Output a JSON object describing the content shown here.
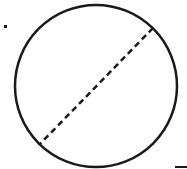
{
  "diagram": {
    "type": "geometry",
    "canvas": {
      "width": 187,
      "height": 169,
      "background": "#ffffff"
    },
    "stroke_color": "#1a1a1a",
    "circle": {
      "cx": 96,
      "cy": 86,
      "r": 81,
      "stroke_width": 2.5
    },
    "diameter": {
      "x1": 153,
      "y1": 28,
      "x2": 39,
      "y2": 145,
      "stroke_width": 2.5,
      "dash": "6 4"
    },
    "dot_mark": {
      "x": 4,
      "y": 25,
      "size": 3
    },
    "tick_mark": {
      "x1": 175,
      "y1": 167,
      "x2": 187,
      "y2": 167,
      "stroke_width": 2
    }
  }
}
